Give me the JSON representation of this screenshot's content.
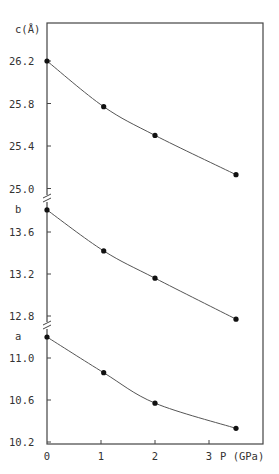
{
  "chart_data": {
    "type": "scatter",
    "title": "",
    "xlabel": "P (GPa)",
    "x_ticks": [
      "0",
      "1",
      "2",
      "3"
    ],
    "xlim": [
      0,
      4
    ],
    "grid": false,
    "legend": "none",
    "panels": [
      {
        "name": "c",
        "ylabel": "c(Å)",
        "y_ticks": [
          "26.2",
          "25.8",
          "25.4",
          "25.0"
        ],
        "x": [
          0,
          1.05,
          2.0,
          3.5
        ],
        "values": [
          26.2,
          25.77,
          25.5,
          25.13
        ],
        "fit_curve": true
      },
      {
        "name": "b",
        "ylabel": "b",
        "y_ticks": [
          "13.6",
          "13.2",
          "12.8"
        ],
        "x": [
          0,
          1.05,
          2.0,
          3.5
        ],
        "values": [
          13.81,
          13.42,
          13.16,
          12.77
        ],
        "fit_curve": true
      },
      {
        "name": "a",
        "ylabel": "a",
        "y_ticks": [
          "11.0",
          "10.6",
          "10.2"
        ],
        "x": [
          0,
          1.05,
          2.0,
          3.5
        ],
        "values": [
          11.2,
          10.86,
          10.57,
          10.33
        ],
        "fit_curve": true
      }
    ],
    "axis_breaks": [
      "between c and b",
      "between b and a"
    ],
    "colors": {
      "line": "#555555",
      "marker": "#111111",
      "frame": "#444444"
    }
  }
}
